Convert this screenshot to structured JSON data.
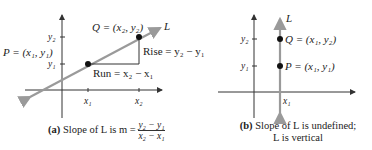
{
  "panel_a": {
    "point_q": "Q = (x₂, y₂)",
    "point_p": "P = (x₁, y₁)",
    "line_label": "L",
    "rise": "Rise = y₂ − y₁",
    "run": "Run = x₂ − x₁",
    "y2": "y₂",
    "y1": "y₁",
    "x1": "x₁",
    "x2": "x₂",
    "caption_tag": "(a)",
    "caption_text": "Slope of L is m =",
    "caption_num": "y₂ − y₁",
    "caption_den": "x₂ − x₁"
  },
  "panel_b": {
    "line_label": "L",
    "point_q": "Q = (x₁, y₂)",
    "point_p": "P = (x₁, y₁)",
    "y2": "y₂",
    "y1": "y₁",
    "x1": "x₁",
    "caption_tag": "(b)",
    "caption_line1": "Slope of L is undefined;",
    "caption_line2": "L is vertical"
  },
  "colors": {
    "line": "#9a9a9a",
    "axis": "#333333",
    "point": "#111111"
  }
}
